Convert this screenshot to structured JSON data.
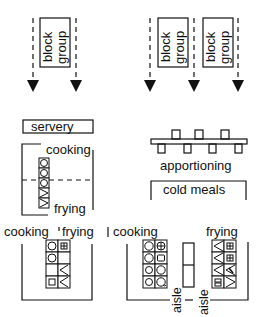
{
  "diagram": {
    "title": "",
    "top_left": {
      "block_group_labels": [
        {
          "line1": "block",
          "line2": "group"
        }
      ],
      "arrows": 2
    },
    "top_right": {
      "block_group_labels": [
        {
          "line1": "block",
          "line2": "group"
        },
        {
          "line1": "block",
          "line2": "group"
        }
      ],
      "arrows": 3
    },
    "middle_left": {
      "servery_label": "servery",
      "cooking_label": "cooking",
      "frying_label": "frying"
    },
    "middle_right": {
      "apportioning_label": "apportioning",
      "cold_meals_label": "cold meals"
    },
    "bottom_left": {
      "cooking_label": "cooking",
      "frying_label": "frying"
    },
    "bottom_right": {
      "cooking_label": "cooking",
      "frying_label": "frying",
      "aisle_labels": [
        "aisle",
        "aisle"
      ]
    },
    "colors": {
      "ink": "#111111",
      "background": "#ffffff"
    }
  }
}
